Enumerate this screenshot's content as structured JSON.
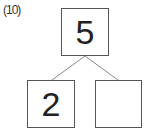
{
  "problem_number": "(10)",
  "number_bond": {
    "whole": "5",
    "parts": [
      "2",
      ""
    ]
  }
}
